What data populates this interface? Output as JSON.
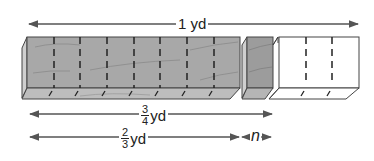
{
  "diagram": {
    "title_label": "1 yd",
    "three_quarter": {
      "numerator": "3",
      "denominator": "4",
      "unit": "yd"
    },
    "two_thirds": {
      "numerator": "2",
      "denominator": "3",
      "unit": "yd"
    },
    "difference_label": "n",
    "colors": {
      "wood_front": "#a8a8a8",
      "wood_top": "#bdbdbd",
      "wood_small": "#9c9c9c",
      "white_piece": "#ffffff",
      "outline": "#444444",
      "arrow": "#555555"
    },
    "segments": {
      "total_divisions": 12,
      "gray_main_divisions": 8,
      "gray_small_divisions": 1,
      "white_divisions": 3
    }
  }
}
